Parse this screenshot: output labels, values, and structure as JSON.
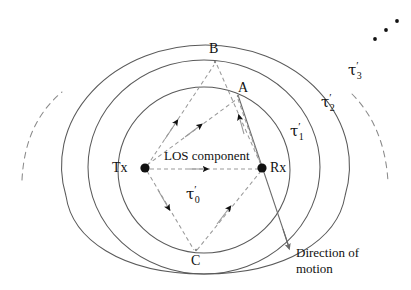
{
  "figure": {
    "background_color": "#ffffff",
    "stroke_color": "#5a5a5a",
    "dashed_color": "#8a8a8a",
    "text_color": "#111111",
    "width": 411,
    "height": 290
  },
  "nodes": {
    "tx": {
      "label": "Tx",
      "x": 145,
      "y": 168
    },
    "rx": {
      "label": "Rx",
      "x": 262,
      "y": 168
    }
  },
  "scatterers": [
    {
      "id": "A",
      "label": "A",
      "x": 238,
      "y": 96
    },
    {
      "id": "B",
      "label": "B",
      "x": 215,
      "y": 60
    },
    {
      "id": "C",
      "label": "C",
      "x": 196,
      "y": 252
    }
  ],
  "los": {
    "label": "LOS component",
    "delay_label": {
      "symbol": "τ",
      "prime": "′",
      "subscript": "0"
    }
  },
  "contours": [
    {
      "id": "tau1",
      "symbol": "τ",
      "prime": "′",
      "subscript": "1",
      "style": "solid"
    },
    {
      "id": "tau2",
      "symbol": "τ",
      "prime": "′",
      "subscript": "2",
      "style": "solid"
    },
    {
      "id": "tau3",
      "symbol": "τ",
      "prime": "′",
      "subscript": "3",
      "style": "solid-with-dashed-ends"
    }
  ],
  "motion": {
    "label_line1": "Direction of",
    "label_line2": "motion"
  },
  "ellipsis": {
    "name": "more-contours-ellipsis",
    "dots": 3
  }
}
